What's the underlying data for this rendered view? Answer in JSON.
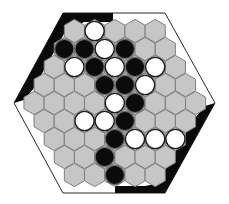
{
  "game": {
    "type": "hex-board",
    "title": "",
    "colors": {
      "board_cell": "#c6c6c6",
      "cell_border": "#7f7f7f",
      "black_stone": "#0b0b0b",
      "white_stone": "#ffffff",
      "frame": "#2a2a2a",
      "black_edge": "#0a0a0a"
    },
    "geometry": {
      "dx": 20.2,
      "dy": 18,
      "hex_radius": 11.6,
      "stone_radius": 9.6,
      "row_y0": 31,
      "widest_row_x0": 34
    },
    "rows": [
      {
        "cells": [
          "",
          "W",
          "",
          "",
          ""
        ]
      },
      {
        "cells": [
          "B",
          "B",
          "W",
          "B",
          "",
          ""
        ]
      },
      {
        "cells": [
          "",
          "W",
          "B",
          "W",
          "B",
          "W",
          ""
        ]
      },
      {
        "cells": [
          "",
          "",
          "",
          "B",
          "B",
          "W",
          "",
          ""
        ]
      },
      {
        "cells": [
          "",
          "",
          "",
          "",
          "W",
          "B",
          "",
          "",
          ""
        ]
      },
      {
        "cells": [
          "",
          "",
          "W",
          "W",
          "B",
          "",
          "",
          ""
        ]
      },
      {
        "cells": [
          "",
          "",
          "",
          "B",
          "W",
          "W",
          "W"
        ]
      },
      {
        "cells": [
          "",
          "",
          "B",
          "",
          "",
          ""
        ]
      },
      {
        "cells": [
          "",
          "",
          "B",
          "",
          ""
        ]
      }
    ],
    "frame": {
      "outer_hexagon": [
        [
          63,
          13
        ],
        [
          165,
          13
        ],
        [
          215,
          103
        ],
        [
          165,
          193
        ],
        [
          63,
          193
        ],
        [
          14,
          103
        ]
      ],
      "black_region_top_left": [
        [
          63,
          13
        ],
        [
          113,
          13
        ],
        [
          113,
          17
        ],
        [
          72,
          17
        ],
        [
          24,
          103
        ],
        [
          14,
          103
        ]
      ],
      "black_region_bottom_right": [
        [
          165,
          193
        ],
        [
          115,
          193
        ],
        [
          115,
          189
        ],
        [
          158,
          189
        ],
        [
          205,
          103
        ],
        [
          215,
          103
        ]
      ]
    },
    "stone_counts": {
      "black": 12,
      "white": 12
    }
  }
}
